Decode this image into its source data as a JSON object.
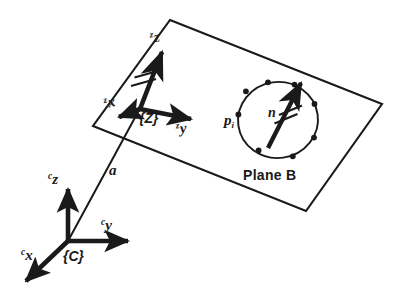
{
  "figure": {
    "background_color": "#ffffff",
    "ink_color": "#1a1a1a"
  },
  "plane": {
    "name": "Plane B",
    "label": "Plane B",
    "corners": [
      {
        "name": "top",
        "x": 170,
        "y": 20
      },
      {
        "name": "right",
        "x": 382,
        "y": 104
      },
      {
        "name": "bottom",
        "x": 306,
        "y": 211
      },
      {
        "name": "left",
        "x": 93,
        "y": 126
      }
    ]
  },
  "frames": {
    "camera": {
      "label": "{C}",
      "origin": {
        "x": 68,
        "y": 241
      },
      "axes": [
        {
          "name": "z",
          "label_presup": "c",
          "label_axis": "z",
          "tip": {
            "x": 68,
            "y": 184
          }
        },
        {
          "name": "y",
          "label_presup": "c",
          "label_axis": "y",
          "tip": {
            "x": 133,
            "y": 241
          }
        },
        {
          "name": "x",
          "label_presup": "c",
          "label_axis": "x",
          "tip": {
            "x": 20,
            "y": 285
          }
        }
      ]
    },
    "plane_frame": {
      "label": "{Z}",
      "origin": {
        "x": 140,
        "y": 109
      },
      "axes": [
        {
          "name": "z",
          "label_presup": "z",
          "label_axis": "z",
          "tip": {
            "x": 164,
            "y": 48
          }
        },
        {
          "name": "y",
          "label_presup": "z",
          "label_axis": "y",
          "tip": {
            "x": 196,
            "y": 120
          }
        },
        {
          "name": "x",
          "label_presup": "z",
          "label_axis": "x",
          "tip": {
            "x": 117,
            "y": 118
          }
        }
      ],
      "tick_marks": 2
    }
  },
  "ray": {
    "label": "a",
    "from": {
      "x": 68,
      "y": 241
    },
    "to": {
      "x": 140,
      "y": 109
    }
  },
  "feature_circle": {
    "center": {
      "x": 278,
      "y": 120
    },
    "radius_x": 40,
    "radius_y": 38,
    "rotation_deg": -8,
    "point_label": "p",
    "point_subscript": "i",
    "points_count": 8,
    "point_angles_deg": [
      178,
      142,
      100,
      58,
      14,
      330,
      290,
      240
    ]
  },
  "normal_vector": {
    "label": "n",
    "base": {
      "x": 268,
      "y": 148
    },
    "tip": {
      "x": 303,
      "y": 79
    },
    "tick_marks": 2
  }
}
